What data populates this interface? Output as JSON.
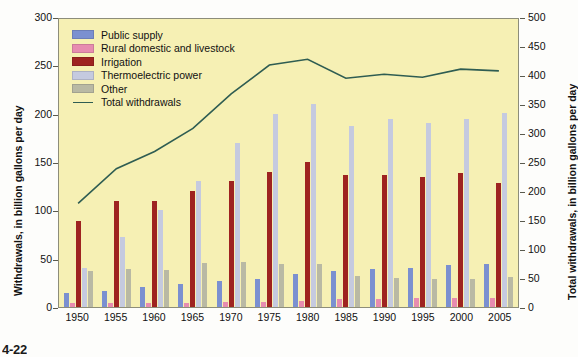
{
  "chart_data": {
    "type": "bar",
    "title": "",
    "subtitle": "",
    "xlabel": "",
    "ylabel": "Withdrawals, in billion gallons per day",
    "ylabel_right": "Total withdrawals, in billion gallons per day",
    "categories": [
      "1950",
      "1955",
      "1960",
      "1965",
      "1970",
      "1975",
      "1980",
      "1985",
      "1990",
      "1995",
      "2000",
      "2005"
    ],
    "ylim": [
      0,
      300
    ],
    "yticks": [
      0,
      50,
      100,
      150,
      200,
      250,
      300
    ],
    "ylim_right": [
      0,
      500
    ],
    "yticks_right": [
      0,
      50,
      100,
      150,
      200,
      250,
      300,
      350,
      400,
      450,
      500
    ],
    "grid": false,
    "legend_position": "upper-left",
    "series": [
      {
        "name": "Public supply",
        "color": "#7b90d0",
        "values": [
          14,
          17,
          21,
          24,
          27,
          29,
          34,
          37,
          39,
          40,
          43,
          44
        ]
      },
      {
        "name": "Rural domestic and livestock",
        "color": "#e78cb0",
        "values": [
          4,
          4,
          4,
          4,
          5,
          5,
          6,
          8,
          8,
          9,
          9,
          9
        ]
      },
      {
        "name": "Irrigation",
        "color": "#9e2320",
        "values": [
          89,
          110,
          110,
          120,
          130,
          140,
          150,
          137,
          137,
          134,
          139,
          128
        ]
      },
      {
        "name": "Thermoelectric power",
        "color": "#c5cadf",
        "values": [
          40,
          72,
          100,
          130,
          170,
          200,
          210,
          187,
          195,
          190,
          195,
          201
        ]
      },
      {
        "name": "Other",
        "color": "#b9b9a4",
        "values": [
          37,
          39,
          38,
          46,
          47,
          45,
          45,
          32,
          30,
          29,
          29,
          31
        ]
      }
    ],
    "line_series": {
      "name": "Total withdrawals",
      "color": "#2f5d52",
      "axis": "right",
      "values": [
        180,
        240,
        270,
        310,
        370,
        420,
        430,
        397,
        404,
        399,
        413,
        410
      ]
    }
  },
  "legend": {
    "items": [
      {
        "label": "Public supply",
        "swatch": "#7b90d0",
        "kind": "swatch"
      },
      {
        "label": "Rural domestic and livestock",
        "swatch": "#e78cb0",
        "kind": "swatch"
      },
      {
        "label": "Irrigation",
        "swatch": "#9e2320",
        "kind": "swatch"
      },
      {
        "label": "Thermoelectric power",
        "swatch": "#c5cadf",
        "kind": "swatch"
      },
      {
        "label": "Other",
        "swatch": "#b9b9a4",
        "kind": "swatch"
      },
      {
        "label": "Total withdrawals",
        "swatch": "#2f5d52",
        "kind": "line"
      }
    ]
  },
  "axes": {
    "left_title": "Withdrawals, in billion gallons per day",
    "right_title": "Total withdrawals, in billion gallons per day"
  },
  "footer": {
    "fragment": "4-22"
  },
  "ghost_text": {
    "line1": "Water Supplies of the",
    "line2": "Water Sources in Water"
  },
  "colors": {
    "plot_background": "#f6f0b4",
    "page_background": "#fdfdfb",
    "axis": "#5a5a4e",
    "text": "#111111"
  }
}
